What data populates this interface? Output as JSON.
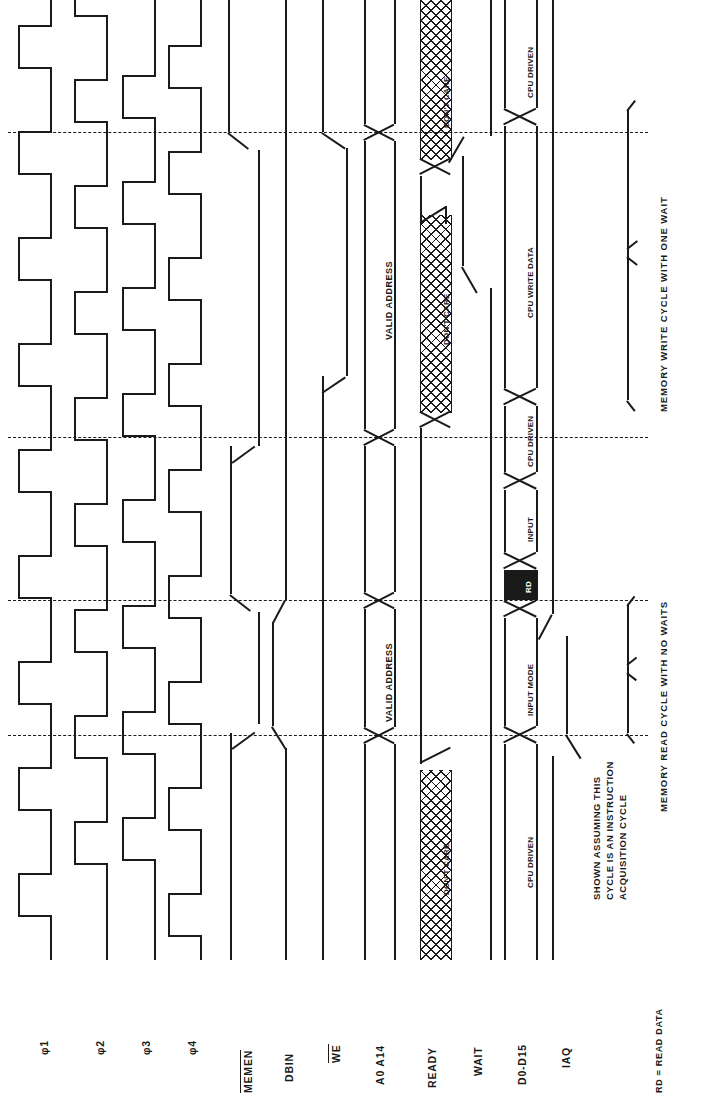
{
  "figure": {
    "orientation": "rotated-90",
    "ink_color": "#1a1a1a",
    "paper_color": "#ffffff"
  },
  "signals": [
    {
      "id": "phi1",
      "label": "φ1",
      "overbar": false,
      "type": "clock"
    },
    {
      "id": "phi2",
      "label": "φ2",
      "overbar": false,
      "type": "clock"
    },
    {
      "id": "phi3",
      "label": "φ3",
      "overbar": false,
      "type": "clock"
    },
    {
      "id": "phi4",
      "label": "φ4",
      "overbar": false,
      "type": "clock"
    },
    {
      "id": "memen",
      "label": "MEMEN",
      "overbar": true,
      "type": "level"
    },
    {
      "id": "dbin",
      "label": "DBIN",
      "overbar": false,
      "type": "level"
    },
    {
      "id": "we",
      "label": "WE",
      "overbar": true,
      "type": "level"
    },
    {
      "id": "addr",
      "label": "A0 A14",
      "overbar": false,
      "type": "bus"
    },
    {
      "id": "ready",
      "label": "READY",
      "overbar": false,
      "type": "bus"
    },
    {
      "id": "wait",
      "label": "WAIT",
      "overbar": false,
      "type": "level"
    },
    {
      "id": "data",
      "label": "D0-D15",
      "overbar": false,
      "type": "bus"
    },
    {
      "id": "iaq",
      "label": "IAQ",
      "overbar": false,
      "type": "level"
    }
  ],
  "bus_labels": {
    "valid_address": "VALID ADDRESS",
    "dont_care": "DON'T CARE",
    "cpu_driven": "CPU DRIVEN",
    "input_mode": "INPUT MODE",
    "rd": "RD",
    "input": "INPUT",
    "cpu_write_data": "CPU WRITE DATA"
  },
  "annotations": {
    "instruction_note": [
      "SHOWN ASSUMING THIS",
      "CYCLE IS AN INSTRUCTION",
      "ACQUISITION CYCLE"
    ],
    "brace_read": "MEMORY READ CYCLE WITH NO WAITS",
    "brace_write": "MEMORY WRITE CYCLE WITH ONE WAIT",
    "footnote": "RD = READ DATA"
  },
  "reference_lines": [
    {
      "id": "ref-1",
      "y": 132
    },
    {
      "id": "ref-2",
      "y": 437
    },
    {
      "id": "ref-3",
      "y": 600
    },
    {
      "id": "ref-4",
      "y": 735
    }
  ]
}
